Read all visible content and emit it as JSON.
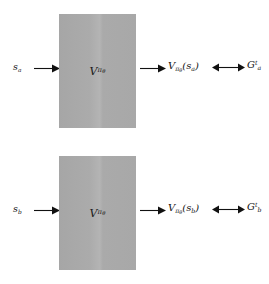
{
  "figure": {
    "type": "flow-diagram",
    "background_color": "#ffffff",
    "box_fill_color": "#a9a9a9",
    "stroke_color": "#111111",
    "rows": [
      {
        "id": "row-a",
        "input_label": "s",
        "input_sub": "a",
        "box_label": "V",
        "box_sub": "π",
        "box_sub_sub": "θ",
        "output_label": "V",
        "output_sub": "π",
        "output_sub_sub": "θ",
        "output_arg_open": "(",
        "output_arg": "s",
        "output_arg_sub": "a",
        "output_arg_close": ")",
        "target_label": "G",
        "target_sub": "a",
        "target_sup": "t",
        "arrow_in": "arrow-right",
        "arrow_out": "arrow-right",
        "arrow_compare": "arrow-double"
      },
      {
        "id": "row-b",
        "input_label": "s",
        "input_sub": "b",
        "box_label": "V",
        "box_sub": "π",
        "box_sub_sub": "θ",
        "output_label": "V",
        "output_sub": "π",
        "output_sub_sub": "θ",
        "output_arg_open": "(",
        "output_arg": "s",
        "output_arg_sub": "b",
        "output_arg_close": ")",
        "target_label": "G",
        "target_sub": "b",
        "target_sup": "t",
        "arrow_in": "arrow-right",
        "arrow_out": "arrow-right",
        "arrow_compare": "arrow-double"
      }
    ]
  }
}
